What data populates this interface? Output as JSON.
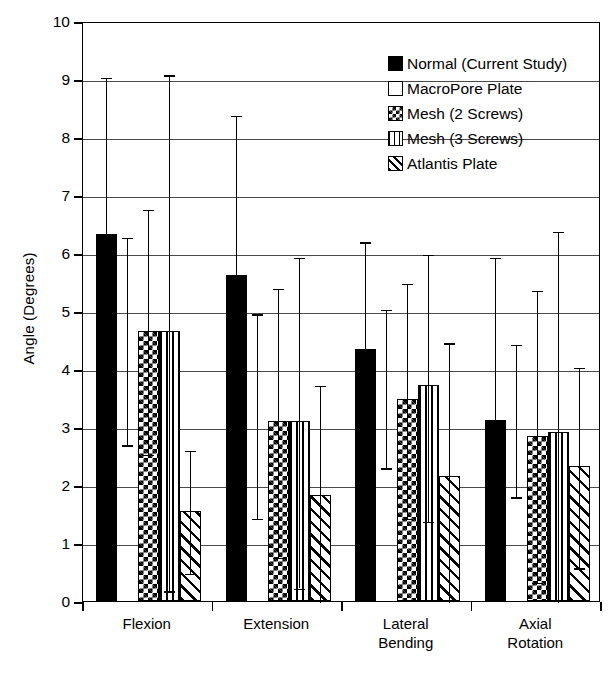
{
  "chart_data": {
    "type": "bar",
    "title": "",
    "xlabel": "",
    "ylabel": "Angle (Degrees)",
    "ylim": [
      0,
      10
    ],
    "yticks": [
      0,
      1,
      2,
      3,
      4,
      5,
      6,
      7,
      8,
      9,
      10
    ],
    "grid": true,
    "legend_position": "top-right",
    "categories": [
      "Flexion",
      "Extension",
      "Lateral Bending",
      "Axial Rotation"
    ],
    "category_lines": [
      [
        "Flexion"
      ],
      [
        "Extension"
      ],
      [
        "Lateral",
        "Bending"
      ],
      [
        "Axial",
        "Rotation"
      ]
    ],
    "series": [
      {
        "name": "Normal (Current Study)",
        "pattern": "solid-black",
        "values": [
          6.32,
          5.62,
          4.35,
          3.12
        ],
        "err_upper": [
          9.05,
          8.4,
          6.22,
          5.95
        ],
        "err_lower": [
          3.15,
          2.72,
          2.9,
          2.85
        ]
      },
      {
        "name": "MacroPore Plate",
        "pattern": "open-white",
        "values": [
          0.0,
          0.0,
          0.0,
          0.0
        ],
        "err_upper": [
          6.3,
          4.98,
          5.05,
          4.45
        ],
        "err_lower": [
          2.72,
          1.45,
          2.32,
          1.82
        ]
      },
      {
        "name": "Mesh (2 Screws)",
        "pattern": "checkered",
        "values": [
          4.65,
          3.1,
          3.48,
          2.85
        ],
        "err_upper": [
          6.78,
          5.42,
          5.5,
          5.38
        ],
        "err_lower": [
          2.55,
          0.78,
          1.45,
          0.35
        ]
      },
      {
        "name": "Mesh (3 Screws)",
        "pattern": "vertical-stripes",
        "values": [
          4.65,
          3.1,
          3.72,
          2.92
        ],
        "err_upper": [
          9.1,
          5.95,
          6.0,
          6.4
        ],
        "err_lower": [
          0.2,
          0.25,
          1.4,
          0.0
        ]
      },
      {
        "name": "Atlantis Plate",
        "pattern": "diagonal-stripes",
        "values": [
          1.55,
          1.82,
          2.15,
          2.32
        ],
        "err_upper": [
          2.62,
          3.75,
          4.48,
          4.05
        ],
        "err_lower": [
          0.5,
          0.0,
          0.0,
          0.6
        ]
      }
    ]
  },
  "legend": {
    "items": [
      {
        "label": "Normal (Current Study)",
        "swatch": "legend-swatch-solid-black"
      },
      {
        "label": "MacroPore Plate",
        "swatch": "legend-swatch-open-white"
      },
      {
        "label": "Mesh (2 Screws)",
        "swatch": "legend-swatch-checkered"
      },
      {
        "label": "Mesh (3 Screws)",
        "swatch": "legend-swatch-vertical-stripes"
      },
      {
        "label": "Atlantis Plate",
        "swatch": "legend-swatch-diagonal-stripes"
      }
    ]
  },
  "axis": {
    "y_title": "Angle (Degrees)",
    "y_tick_labels": [
      "10",
      "9",
      "8",
      "7",
      "6",
      "5",
      "4",
      "3",
      "2",
      "1",
      "0"
    ]
  },
  "colors": {
    "foreground": "#000000",
    "background": "#ffffff",
    "gridline": "#4a4a4a"
  }
}
